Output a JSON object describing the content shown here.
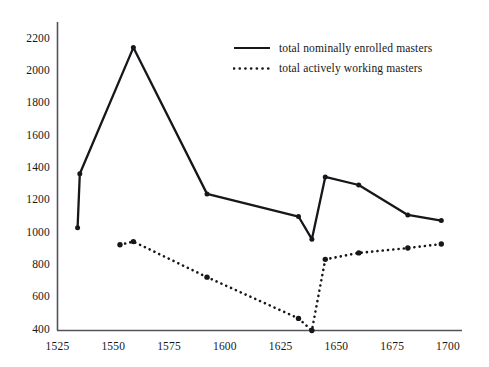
{
  "chart_data": {
    "type": "line",
    "title": "",
    "subtitle": "",
    "xlabel": "",
    "ylabel": "",
    "xlim": [
      1525,
      1700
    ],
    "ylim": [
      400,
      2200
    ],
    "xticks": [
      1525,
      1550,
      1575,
      1600,
      1625,
      1650,
      1675,
      1700
    ],
    "yticks": [
      400,
      600,
      800,
      1000,
      1200,
      1400,
      1600,
      1800,
      2000,
      2200
    ],
    "grid": false,
    "legend_position": "upper-center-right",
    "series": [
      {
        "name": "total nominally enrolled masters",
        "style": "solid",
        "color": "#17161a",
        "markers": true,
        "x": [
          1534,
          1535,
          1559,
          1592,
          1633,
          1639,
          1645,
          1660,
          1682,
          1697
        ],
        "values": [
          1035,
          1370,
          2150,
          1245,
          1105,
          965,
          1350,
          1300,
          1115,
          1080
        ]
      },
      {
        "name": "total actively working masters",
        "style": "dotted",
        "color": "#17161a",
        "markers": true,
        "x": [
          1553,
          1559,
          1592,
          1633,
          1639,
          1645,
          1660,
          1682,
          1697
        ],
        "values": [
          930,
          950,
          730,
          475,
          400,
          840,
          880,
          910,
          935
        ]
      }
    ]
  },
  "legend": {
    "items": [
      {
        "label": "total nominally enrolled masters",
        "style": "solid"
      },
      {
        "label": "total actively working masters",
        "style": "dotted"
      }
    ]
  },
  "axes": {
    "y_labels": [
      "2200",
      "2000",
      "1800",
      "1600",
      "1400",
      "1200",
      "1000",
      "800",
      "600",
      "400"
    ],
    "x_labels": [
      "1525",
      "1550",
      "1575",
      "1600",
      "1625",
      "1650",
      "1675",
      "1700"
    ]
  },
  "colors": {
    "ink": "#17161a",
    "axis": "#55535a",
    "background": "#ffffff"
  }
}
